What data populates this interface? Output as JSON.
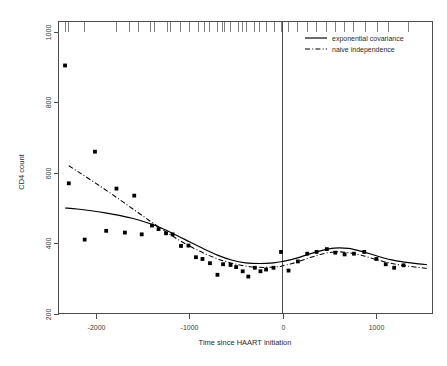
{
  "chart_data": {
    "type": "scatter",
    "title": "",
    "xlabel": "Time since HAART initiation",
    "ylabel": "CD4 count",
    "xlim": [
      -2400,
      1600
    ],
    "ylim": [
      200,
      1030
    ],
    "grid": false,
    "xticks": [
      -2000,
      -1000,
      0,
      1000
    ],
    "xticklabels": [
      "-2000",
      "-1000",
      "0",
      "1000"
    ],
    "yticks": [
      200,
      400,
      600,
      800,
      1000
    ],
    "yticklabels": [
      "200",
      "400",
      "600",
      "800",
      "1000"
    ],
    "legend_position": "top-right",
    "annotations": [
      {
        "name": "haart-initiation-vline",
        "type": "vline",
        "x": 0
      }
    ],
    "rug_positions": [
      -2330,
      -2290,
      -2120,
      -1780,
      -1640,
      -1540,
      -1420,
      -1370,
      -1230,
      -1200,
      -1090,
      -1000,
      -900,
      -840,
      -790,
      -700,
      -650,
      -620,
      -560,
      -480,
      -430,
      -390,
      -300,
      -250,
      -180,
      -90,
      -10,
      60,
      160,
      260,
      360,
      470,
      560,
      660,
      760,
      880,
      1010,
      1130,
      1340
    ],
    "points": {
      "name": "observed means",
      "x": [
        -2330,
        -2290,
        -2120,
        -2010,
        -1890,
        -1780,
        -1690,
        -1590,
        -1510,
        -1400,
        -1330,
        -1250,
        -1180,
        -1090,
        -1010,
        -930,
        -860,
        -780,
        -700,
        -640,
        -560,
        -500,
        -430,
        -370,
        -300,
        -240,
        -180,
        -100,
        -20,
        60,
        160,
        260,
        360,
        470,
        560,
        660,
        760,
        870,
        1000,
        1100,
        1190,
        1290
      ],
      "y": [
        905,
        570,
        410,
        660,
        435,
        555,
        430,
        535,
        425,
        450,
        440,
        428,
        425,
        392,
        393,
        360,
        355,
        343,
        310,
        340,
        338,
        332,
        320,
        305,
        330,
        320,
        325,
        330,
        375,
        322,
        348,
        370,
        375,
        383,
        373,
        368,
        370,
        375,
        355,
        340,
        330,
        337
      ]
    },
    "series": [
      {
        "name": "exponential covariance",
        "style": "solid",
        "x": [
          -2330,
          -2200,
          -2050,
          -1900,
          -1750,
          -1600,
          -1450,
          -1300,
          -1150,
          -1000,
          -850,
          -700,
          -550,
          -400,
          -250,
          -100,
          0,
          100,
          250,
          400,
          550,
          700,
          850,
          1000,
          1150,
          1300,
          1450,
          1540
        ],
        "y": [
          500,
          497,
          492,
          486,
          479,
          470,
          458,
          443,
          424,
          404,
          384,
          366,
          352,
          344,
          342,
          344,
          348,
          354,
          366,
          378,
          386,
          385,
          376,
          364,
          353,
          346,
          341,
          339
        ]
      },
      {
        "name": "naive independence",
        "style": "dashdot",
        "x": [
          -2290,
          -2150,
          -2000,
          -1850,
          -1700,
          -1550,
          -1400,
          -1250,
          -1100,
          -950,
          -800,
          -650,
          -500,
          -350,
          -200,
          -50,
          0,
          100,
          250,
          400,
          550,
          700,
          850,
          1000,
          1150,
          1300,
          1450,
          1540
        ],
        "y": [
          620,
          596,
          570,
          543,
          515,
          487,
          459,
          432,
          407,
          385,
          366,
          351,
          340,
          333,
          331,
          333,
          336,
          342,
          355,
          368,
          375,
          373,
          365,
          353,
          343,
          336,
          331,
          328
        ]
      }
    ],
    "legend": [
      {
        "label": "exponential covariance",
        "style": "solid"
      },
      {
        "label": "naive independence",
        "style": "dashdot"
      }
    ]
  }
}
